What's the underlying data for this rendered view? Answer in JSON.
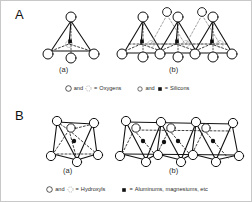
{
  "figure": {
    "background": "#ffffff",
    "border_color": "#c8c8c8",
    "ink_color": "#111111"
  },
  "panels": [
    {
      "letter": "A",
      "subject": "silica-tetrahedra",
      "parts": [
        {
          "label": "(a)",
          "caption_name": "single-tetrahedron"
        },
        {
          "label": "(b)",
          "caption_name": "tetrahedral-sheet"
        }
      ],
      "legend": [
        {
          "symbols": [
            "open-circle",
            "dotted-circle"
          ],
          "connector": "and",
          "equals": "=",
          "text": "Oxygens",
          "full": "and  =  Oxygens"
        },
        {
          "symbols": [
            "small-open-circle",
            "filled-square"
          ],
          "connector": "and",
          "equals": "=",
          "text": "Silicons",
          "full": "and  =  Silicons"
        }
      ]
    },
    {
      "letter": "B",
      "subject": "alumina-octahedra",
      "parts": [
        {
          "label": "(a)",
          "caption_name": "single-octahedron"
        },
        {
          "label": "(b)",
          "caption_name": "octahedral-sheet"
        }
      ],
      "legend": [
        {
          "symbols": [
            "open-circle",
            "dotted-circle"
          ],
          "connector": "and",
          "equals": "=",
          "text": "Hydroxyls",
          "full": "and  =  Hydroxyls"
        },
        {
          "symbols": [
            "filled-square"
          ],
          "connector": "",
          "equals": "=",
          "text": "Aluminums, magnesiums, etc",
          "full": "=  Aluminums, magnesiums, etc"
        }
      ]
    }
  ],
  "legend_words": {
    "and": "and",
    "equals": "="
  }
}
